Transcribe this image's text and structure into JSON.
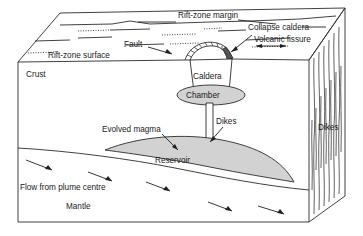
{
  "diagram": {
    "type": "geological-block-diagram",
    "colors": {
      "line": "#2b2b2b",
      "magma_fill": "#d2d2d2",
      "vent_fill": "#555555",
      "background": "#ffffff",
      "text": "#1a1a1a"
    },
    "labels": {
      "rift_zone_margin": "Rift-zone margin",
      "collapse_caldera": "Collapse caldera",
      "volcanic_fissure": "Volcanic fissure",
      "fault": "Fault",
      "rift_zone_surface": "Rift-zone surface",
      "caldera": "Caldera",
      "chamber": "Chamber",
      "crust": "Crust",
      "dikes_centre": "Dikes",
      "dikes_right": "Dikes",
      "evolved_magma": "Evolved magma",
      "reservoir": "Reservoir",
      "flow_from_plume_centre": "Flow from plume centre",
      "mantle": "Mantle"
    },
    "features": [
      {
        "name": "top-surface",
        "label": "Rift-zone surface",
        "kind": "plane"
      },
      {
        "name": "fault-set",
        "label": "Fault",
        "kind": "line-set",
        "count": 12
      },
      {
        "name": "collapse-caldera",
        "label": "Collapse caldera",
        "kind": "depression"
      },
      {
        "name": "volcanic-fissure",
        "label": "Volcanic fissure",
        "kind": "fissure"
      },
      {
        "name": "caldera-body",
        "label": "Caldera",
        "kind": "trapezoid"
      },
      {
        "name": "magma-chamber",
        "label": "Chamber",
        "kind": "ellipse"
      },
      {
        "name": "vertical-dike",
        "label": "Dikes",
        "kind": "conduit"
      },
      {
        "name": "magma-reservoir",
        "label": "Reservoir",
        "kind": "lens"
      },
      {
        "name": "crust-layer",
        "label": "Crust",
        "kind": "layer"
      },
      {
        "name": "mantle-layer",
        "label": "Mantle",
        "kind": "layer"
      },
      {
        "name": "plume-flow-arrows",
        "label": "Flow from plume centre",
        "kind": "arrow-set",
        "count": 5
      },
      {
        "name": "side-dike-swarm",
        "label": "Dikes",
        "kind": "line-set",
        "count": 13
      }
    ]
  }
}
